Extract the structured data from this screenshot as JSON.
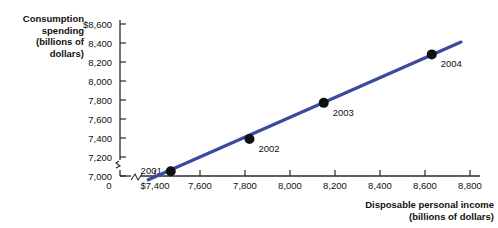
{
  "chart_data": {
    "type": "scatter",
    "title": "",
    "xlabel": "Disposable personal income\n(billions of dollars)",
    "ylabel": "Consumption spending\n(billions of dollars)",
    "xlim": [
      7300,
      8800
    ],
    "ylim": [
      6900,
      8600
    ],
    "grid": false,
    "legend": "none",
    "x_ticks": [
      "$7,400",
      "7,600",
      "7,800",
      "8,000",
      "8,200",
      "8,400",
      "8,600",
      "8,800"
    ],
    "x_tick_values": [
      7400,
      7600,
      7800,
      8000,
      8200,
      8400,
      8600,
      8800
    ],
    "y_ticks": [
      "$8,600",
      "8,400",
      "8,200",
      "8,000",
      "7,800",
      "7,600",
      "7,400",
      "7,200",
      "7,000"
    ],
    "y_tick_values": [
      8600,
      8400,
      8200,
      8000,
      7800,
      7600,
      7400,
      7200,
      7000
    ],
    "origin_label": "0",
    "axis_break": true,
    "points": [
      {
        "label": "2001",
        "x": 7470,
        "y": 7050,
        "label_side": "left"
      },
      {
        "label": "2002",
        "x": 7820,
        "y": 7390,
        "label_side": "right"
      },
      {
        "label": "2003",
        "x": 8150,
        "y": 7770,
        "label_side": "right"
      },
      {
        "label": "2004",
        "x": 8630,
        "y": 8280,
        "label_side": "right"
      }
    ],
    "trend_line": {
      "x_start": 7370,
      "y_start": 6960,
      "x_end": 8760,
      "y_end": 8410
    },
    "colors": {
      "line": "#3b4a9e",
      "marker": "#111111",
      "axis": "#2b2b2b",
      "text": "#111111",
      "background": "#ffffff"
    }
  }
}
